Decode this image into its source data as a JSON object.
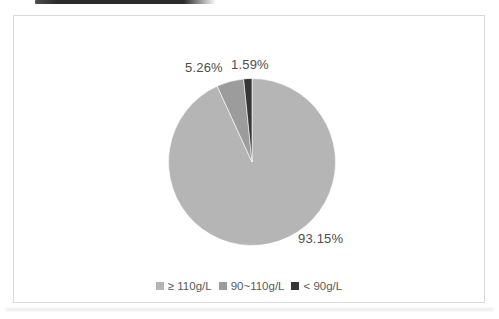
{
  "chart_data": {
    "type": "pie",
    "title": "",
    "categories": [
      "≥ 110g/L",
      "90~110g/L",
      "< 90g/L"
    ],
    "values": [
      93.15,
      5.26,
      1.59
    ],
    "value_labels": [
      "93.15%",
      "5.26%",
      "1.59%"
    ],
    "colors": [
      "#b5b5b5",
      "#9c9c9c",
      "#363636"
    ],
    "start_angle_deg": -90,
    "direction": "clockwise",
    "legend_position": "bottom",
    "label_color": "#4d4d4d",
    "legend_text_color": "#595959",
    "frame_border_color": "#d9d9d9",
    "background": "#ffffff"
  }
}
